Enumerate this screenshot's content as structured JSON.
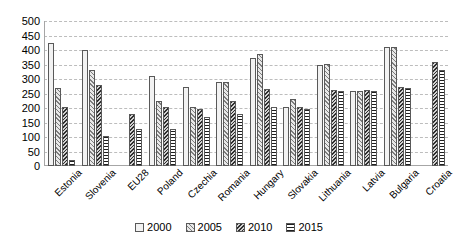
{
  "chart_data": {
    "type": "bar",
    "title": "",
    "subtitle": "",
    "xlabel": "",
    "ylabel": "",
    "ylim": [
      0,
      500
    ],
    "ytick_step": 50,
    "yticks": [
      500,
      450,
      400,
      350,
      300,
      250,
      200,
      150,
      100,
      50,
      0
    ],
    "grid": true,
    "legend_position": "bottom",
    "categories": [
      "Estonia",
      "Slovenia",
      "EU28",
      "Poland",
      "Czechia",
      "Romania",
      "Hungary",
      "Slovakia",
      "Lithuania",
      "Latvia",
      "Bulgaria",
      "Croatia"
    ],
    "series": [
      {
        "name": "2000",
        "pattern": "fine-dotted",
        "values": [
          425,
          400,
          null,
          310,
          272,
          290,
          372,
          205,
          348,
          258,
          410,
          null
        ]
      },
      {
        "name": "2005",
        "pattern": "light-diagonal-hatch",
        "values": [
          268,
          330,
          null,
          225,
          205,
          288,
          385,
          232,
          352,
          258,
          412,
          null
        ]
      },
      {
        "name": "2010",
        "pattern": "dense-diagonal-hatch",
        "values": [
          202,
          278,
          180,
          205,
          196,
          225,
          265,
          205,
          262,
          262,
          272,
          360
        ]
      },
      {
        "name": "2015",
        "pattern": "horizontal-bands",
        "values": [
          22,
          103,
          128,
          128,
          168,
          180,
          205,
          196,
          258,
          258,
          268,
          330
        ]
      }
    ]
  },
  "legend": {
    "items": [
      {
        "label": "2000"
      },
      {
        "label": "2005"
      },
      {
        "label": "2010"
      },
      {
        "label": "2015"
      }
    ]
  }
}
